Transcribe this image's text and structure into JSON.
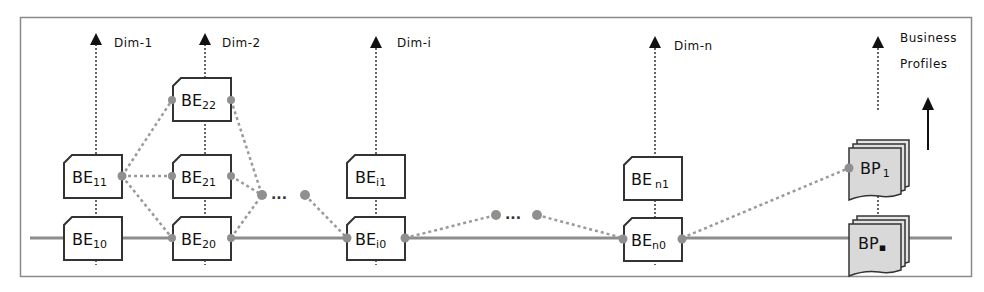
{
  "diagram": {
    "frame": {
      "stroke": "#8a8a8a"
    },
    "colors": {
      "line": "#8c8c8c",
      "dotted": "#9a9a9a",
      "node_dot": "#8f8f8f",
      "box_stroke": "#333333",
      "box_fill": "#ffffff",
      "bp_fill": "#d9d9d9",
      "arrow": "#111111"
    },
    "dimensions": [
      {
        "id": "dim-1",
        "label": "Dim-1"
      },
      {
        "id": "dim-2",
        "label": "Dim-2"
      },
      {
        "id": "dim-i",
        "label": "Dim-i"
      },
      {
        "id": "dim-n",
        "label": "Dim-n"
      }
    ],
    "business_profiles_label": {
      "line1": "Business",
      "line2": "Profiles"
    },
    "entities": {
      "be11": {
        "base": "BE",
        "sub": "11"
      },
      "be10": {
        "base": "BE",
        "sub": "10"
      },
      "be22": {
        "base": "BE",
        "sub": "22"
      },
      "be21": {
        "base": "BE",
        "sub": "21"
      },
      "be20": {
        "base": "BE",
        "sub": "20"
      },
      "bei1": {
        "base": "BE",
        "sub": "i1"
      },
      "bei0": {
        "base": "BE",
        "sub": "i0"
      },
      "ben1": {
        "base": "BE",
        "sub": "n1"
      },
      "ben0": {
        "base": "BE",
        "sub": "n0"
      }
    },
    "profiles": {
      "bp1": {
        "base": "BP",
        "sub": "1"
      },
      "bpn": {
        "base": "BP",
        "sub": "▪"
      }
    },
    "ellipsis": "..."
  }
}
